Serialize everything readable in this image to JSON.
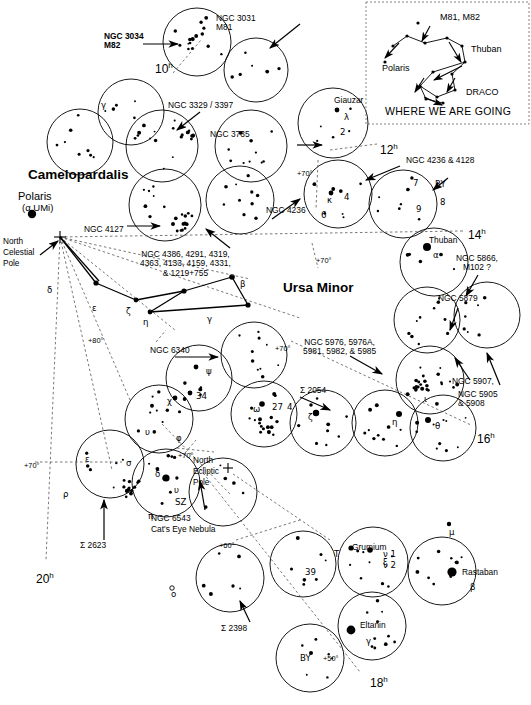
{
  "chart": {
    "width": 531,
    "height": 705,
    "background": "#ffffff",
    "ink": "#000000"
  },
  "constellations": [
    {
      "name": "Camelopardalis",
      "x": 28,
      "y": 174,
      "size": 13.5
    },
    {
      "name": "Ursa Minor",
      "x": 283,
      "y": 287,
      "size": 13.5
    }
  ],
  "poles": [
    {
      "name": "Polaris",
      "x": 22,
      "y": 197
    },
    {
      "name": "(α UMi)",
      "x": 24,
      "y": 209
    },
    {
      "name": "North\nCelestial\nPole",
      "x": 4,
      "y": 243
    },
    {
      "name": "North\nEcliptic\nPole",
      "x": 197,
      "y": 467
    }
  ],
  "deep_sky_labels": [
    {
      "text": "NGC 3034\nM82",
      "x": 108,
      "y": 38,
      "bold_second": true
    },
    {
      "text": "NGC 3031\nM81",
      "x": 218,
      "y": 18
    },
    {
      "text": "NGC 3329 / 3397",
      "x": 172,
      "y": 106
    },
    {
      "text": "NGC 3735",
      "x": 212,
      "y": 134
    },
    {
      "text": "NGC 4236 & 4128",
      "x": 408,
      "y": 160
    },
    {
      "text": "NGC 4236",
      "x": 268,
      "y": 210
    },
    {
      "text": "NGC 4127",
      "x": 86,
      "y": 229
    },
    {
      "text": "NGC 4386, 4291, 4319,\n4363, 4133, 4159, 4331,\n& 1219+755",
      "x": 143,
      "y": 255
    },
    {
      "text": "NGC 5866,\nM102 ?",
      "x": 459,
      "y": 260
    },
    {
      "text": "NGC 5879",
      "x": 440,
      "y": 298
    },
    {
      "text": "NGC 5907,",
      "x": 455,
      "y": 381
    },
    {
      "text": "NGC 5905\n& 5908",
      "x": 460,
      "y": 397
    },
    {
      "text": "NGC 6340",
      "x": 152,
      "y": 350
    },
    {
      "text": "NGC 5976, 5976A,\n5981, 5982, & 5985",
      "x": 307,
      "y": 342
    },
    {
      "text": "Σ 2054",
      "x": 303,
      "y": 390
    },
    {
      "text": "NGC 6543",
      "x": 153,
      "y": 518
    },
    {
      "text": "Cat's Eye Nebula",
      "x": 153,
      "y": 529
    },
    {
      "text": "Σ 2623",
      "x": 82,
      "y": 545
    },
    {
      "text": "Σ 2398",
      "x": 223,
      "y": 628
    }
  ],
  "star_names": [
    {
      "text": "Giauzar",
      "x": 336,
      "y": 100
    },
    {
      "text": "Thuban",
      "x": 431,
      "y": 240
    },
    {
      "text": "Grumium",
      "x": 385,
      "y": 547
    },
    {
      "text": "Rastaban",
      "x": 464,
      "y": 572
    },
    {
      "text": "Eltanin",
      "x": 366,
      "y": 625
    }
  ],
  "greek_labels": [
    {
      "text": "γ",
      "x": 101,
      "y": 101
    },
    {
      "text": "λ",
      "x": 344,
      "y": 113
    },
    {
      "text": "2",
      "x": 340,
      "y": 128
    },
    {
      "text": "κ",
      "x": 327,
      "y": 196
    },
    {
      "text": "4",
      "x": 344,
      "y": 193
    },
    {
      "text": "6",
      "x": 321,
      "y": 211
    },
    {
      "text": "7",
      "x": 413,
      "y": 179
    },
    {
      "text": "RY",
      "x": 435,
      "y": 180
    },
    {
      "text": "8",
      "x": 440,
      "y": 198
    },
    {
      "text": "9",
      "x": 416,
      "y": 205
    },
    {
      "text": "α",
      "x": 433,
      "y": 251
    },
    {
      "text": "δ",
      "x": 47,
      "y": 286
    },
    {
      "text": "ε",
      "x": 92,
      "y": 304
    },
    {
      "text": "ζ",
      "x": 126,
      "y": 307
    },
    {
      "text": "η",
      "x": 143,
      "y": 318
    },
    {
      "text": "β",
      "x": 240,
      "y": 280
    },
    {
      "text": "γ",
      "x": 207,
      "y": 315
    },
    {
      "text": "ψ",
      "x": 206,
      "y": 367
    },
    {
      "text": "34",
      "x": 196,
      "y": 392
    },
    {
      "text": "χ",
      "x": 167,
      "y": 397
    },
    {
      "text": "υ",
      "x": 145,
      "y": 428
    },
    {
      "text": "φ",
      "x": 176,
      "y": 434
    },
    {
      "text": "ω",
      "x": 253,
      "y": 405
    },
    {
      "text": "27",
      "x": 272,
      "y": 403
    },
    {
      "text": "4",
      "x": 287,
      "y": 403
    },
    {
      "text": "ζ",
      "x": 308,
      "y": 413
    },
    {
      "text": "η",
      "x": 392,
      "y": 418
    },
    {
      "text": "θ",
      "x": 435,
      "y": 422
    },
    {
      "text": "ι",
      "x": 424,
      "y": 395
    },
    {
      "text": "ε",
      "x": 85,
      "y": 455
    },
    {
      "text": "σ",
      "x": 126,
      "y": 459
    },
    {
      "text": "ρ",
      "x": 63,
      "y": 490
    },
    {
      "text": "δ",
      "x": 155,
      "y": 470
    },
    {
      "text": "υ",
      "x": 174,
      "y": 486
    },
    {
      "text": "SZ",
      "x": 175,
      "y": 498
    },
    {
      "text": "π",
      "x": 148,
      "y": 512
    },
    {
      "text": "μ",
      "x": 449,
      "y": 528
    },
    {
      "text": "ν 1",
      "x": 383,
      "y": 550
    },
    {
      "text": "ν 2",
      "x": 383,
      "y": 561
    },
    {
      "text": "ξ",
      "x": 383,
      "y": 558
    },
    {
      "text": "β",
      "x": 470,
      "y": 583
    },
    {
      "text": "γ",
      "x": 366,
      "y": 637
    },
    {
      "text": "T",
      "x": 334,
      "y": 550
    },
    {
      "text": "39",
      "x": 305,
      "y": 568
    },
    {
      "text": "BY",
      "x": 300,
      "y": 654
    },
    {
      "text": "o",
      "x": 171,
      "y": 590
    }
  ],
  "hour_labels": [
    {
      "h": "10",
      "sup": "h",
      "x": 155,
      "y": 62
    },
    {
      "h": "12",
      "sup": "h",
      "x": 380,
      "y": 143
    },
    {
      "h": "14",
      "sup": "h",
      "x": 468,
      "y": 228
    },
    {
      "h": "16",
      "sup": "h",
      "x": 477,
      "y": 432
    },
    {
      "h": "18",
      "sup": "h",
      "x": 370,
      "y": 676
    },
    {
      "h": "20",
      "sup": "h",
      "x": 36,
      "y": 572
    }
  ],
  "dec_labels": [
    {
      "text": "+70°",
      "x": 297,
      "y": 170
    },
    {
      "text": "+70°",
      "x": 316,
      "y": 257
    },
    {
      "text": "+80°",
      "x": 88,
      "y": 337
    },
    {
      "text": "+70°",
      "x": 275,
      "y": 345
    },
    {
      "text": "+70°",
      "x": 178,
      "y": 452
    },
    {
      "text": "+70°",
      "x": 24,
      "y": 462
    },
    {
      "text": "+60°",
      "x": 219,
      "y": 542
    },
    {
      "text": "+50°",
      "x": 323,
      "y": 655
    }
  ],
  "inset": {
    "title": "WHERE WE ARE GOING",
    "labels": [
      {
        "text": "M81, M82",
        "x": 440,
        "y": 16
      },
      {
        "text": "Thuban",
        "x": 473,
        "y": 48
      },
      {
        "text": "Polaris",
        "x": 384,
        "y": 67
      },
      {
        "text": "DRACO",
        "x": 468,
        "y": 91
      }
    ],
    "box": {
      "x": 366,
      "y": 2,
      "w": 163,
      "h": 122
    }
  },
  "legend_note": "Finder circles show telescopic fields along the path from Ursa Major through Camelopardalis, Ursa Minor and Draco.",
  "fields": [
    {
      "name": "M81 / M82 field",
      "cx": 197,
      "cy": 42,
      "r": 34
    },
    {
      "name": "field-2",
      "cx": 256,
      "cy": 70,
      "r": 32
    },
    {
      "name": "gamma field",
      "cx": 131,
      "cy": 112,
      "r": 33
    },
    {
      "name": "field-4",
      "cx": 80,
      "cy": 142,
      "r": 33
    },
    {
      "name": "NGC 3329 field",
      "cx": 162,
      "cy": 146,
      "r": 36
    },
    {
      "name": "NGC 3735 field",
      "cx": 251,
      "cy": 146,
      "r": 36
    },
    {
      "name": "Giauzar field",
      "cx": 333,
      "cy": 123,
      "r": 35
    },
    {
      "name": "NGC 4127 field",
      "cx": 165,
      "cy": 205,
      "r": 36
    },
    {
      "name": "field-9",
      "cx": 240,
      "cy": 200,
      "r": 34
    },
    {
      "name": "NGC 4236 field",
      "cx": 338,
      "cy": 194,
      "r": 34
    },
    {
      "name": "RY field",
      "cx": 403,
      "cy": 204,
      "r": 34
    },
    {
      "name": "Thuban field",
      "cx": 434,
      "cy": 262,
      "r": 34
    },
    {
      "name": "NGC 5879 field",
      "cx": 427,
      "cy": 320,
      "r": 33
    },
    {
      "name": "NGC 5866 field",
      "cx": 487,
      "cy": 315,
      "r": 33
    },
    {
      "name": "iota field",
      "cx": 430,
      "cy": 380,
      "r": 34
    },
    {
      "name": "psi field",
      "cx": 199,
      "cy": 378,
      "r": 33
    },
    {
      "name": "NGC 6340 field",
      "cx": 254,
      "cy": 355,
      "r": 33
    },
    {
      "name": "omega field",
      "cx": 264,
      "cy": 414,
      "r": 33
    },
    {
      "name": "upsilon field",
      "cx": 159,
      "cy": 419,
      "r": 34
    },
    {
      "name": "sigma field",
      "cx": 110,
      "cy": 464,
      "r": 34
    },
    {
      "name": "delta field",
      "cx": 166,
      "cy": 483,
      "r": 34
    },
    {
      "name": "zeta field",
      "cx": 323,
      "cy": 423,
      "r": 33
    },
    {
      "name": "eta field",
      "cx": 385,
      "cy": 423,
      "r": 33
    },
    {
      "name": "theta field",
      "cx": 443,
      "cy": 428,
      "r": 33
    },
    {
      "name": "NEP field",
      "cx": 223,
      "cy": 492,
      "r": 34
    },
    {
      "name": "sigma2398 field",
      "cx": 230,
      "cy": 578,
      "r": 34
    },
    {
      "name": "39 field",
      "cx": 303,
      "cy": 564,
      "r": 33
    },
    {
      "name": "Grumium field",
      "cx": 373,
      "cy": 562,
      "r": 35
    },
    {
      "name": "Rastaban field",
      "cx": 442,
      "cy": 571,
      "r": 34
    },
    {
      "name": "Eltanin field",
      "cx": 372,
      "cy": 626,
      "r": 34
    },
    {
      "name": "BY field",
      "cx": 310,
      "cy": 658,
      "r": 34
    }
  ]
}
